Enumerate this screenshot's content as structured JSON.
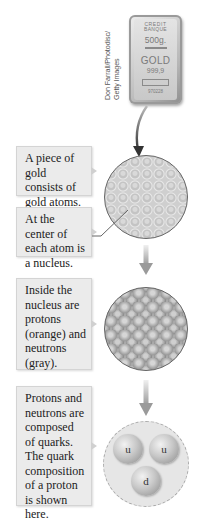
{
  "photo": {
    "credit_line1": "Don Farrall/Photodisc/",
    "credit_line2": "Getty Images",
    "gold_bar": {
      "line1": "CREDIT",
      "line2": "BANQUE",
      "weight": "500g.",
      "metal": "GOLD",
      "purity": "999,9",
      "serial": "970228"
    }
  },
  "steps": [
    {
      "caption": "A piece of gold consists of gold atoms."
    },
    {
      "caption": "At the center of each atom is a nucleus."
    },
    {
      "caption": "Inside the nucleus are protons (orange) and neutrons (gray)."
    },
    {
      "caption": "Protons and neutrons are composed of quarks. The quark composition of a proton is shown here."
    }
  ],
  "quarks": [
    {
      "label": "u"
    },
    {
      "label": "u"
    },
    {
      "label": "d"
    }
  ]
}
